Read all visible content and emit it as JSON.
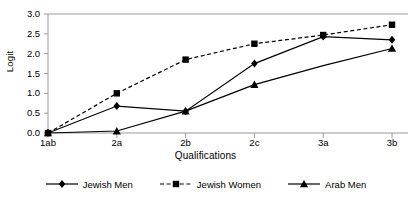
{
  "chart_data": {
    "type": "line",
    "title": "",
    "xlabel": "Qualifications",
    "ylabel": "Logit",
    "categories": [
      "1ab",
      "2a",
      "2b",
      "2c",
      "3a",
      "3b"
    ],
    "ylim": [
      0.0,
      3.0
    ],
    "yticks": [
      "0.0",
      "0.5",
      "1.0",
      "1.5",
      "2.0",
      "2.5",
      "3.0"
    ],
    "ytick_values": [
      0.0,
      0.5,
      1.0,
      1.5,
      2.0,
      2.5,
      3.0
    ],
    "grid": false,
    "legend_position": "bottom",
    "series": [
      {
        "name": "Jewish Men",
        "marker": "diamond",
        "linestyle": "solid",
        "color": "#000000",
        "values": [
          0.0,
          0.68,
          0.55,
          1.75,
          2.43,
          2.35
        ]
      },
      {
        "name": "Jewish Women",
        "marker": "square",
        "linestyle": "dashed",
        "color": "#000000",
        "values": [
          0.0,
          1.0,
          1.85,
          2.25,
          2.47,
          2.73
        ]
      },
      {
        "name": "Arab Men",
        "marker": "triangle",
        "linestyle": "solid",
        "color": "#000000",
        "values": [
          0.0,
          0.05,
          0.55,
          1.22,
          1.7,
          2.13
        ]
      }
    ]
  },
  "colors": {
    "series": "#000000",
    "axis": "#9a9a9a",
    "background": "#ffffff"
  }
}
